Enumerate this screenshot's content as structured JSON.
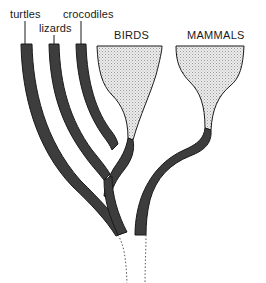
{
  "diagram": {
    "type": "phylogenetic-tree",
    "labels": {
      "turtles": "turtles",
      "lizards": "lizards",
      "crocodiles": "crocodiles",
      "birds": "BIRDS",
      "mammals": "MAMMALS"
    },
    "colors": {
      "branch_fill": "#3d3d3d",
      "branch_outline": "#1a1a1a",
      "clade_fill": "#dcdcdc",
      "clade_outline": "#1a1a1a",
      "root_dotted": "#555555",
      "background": "#ffffff"
    },
    "lineages": [
      {
        "name": "turtles",
        "style": "dark-band"
      },
      {
        "name": "lizards",
        "style": "dark-band"
      },
      {
        "name": "crocodiles",
        "style": "dark-band"
      },
      {
        "name": "BIRDS",
        "style": "stippled-funnel"
      },
      {
        "name": "MAMMALS",
        "style": "stippled-funnel"
      }
    ]
  }
}
